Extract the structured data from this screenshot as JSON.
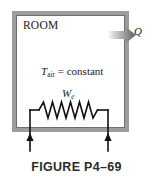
{
  "figure": {
    "caption": "FIGURE P4–69",
    "room_label": "ROOM",
    "temperature_label": {
      "symbol": "T",
      "subscript": "air",
      "relation": " = constant",
      "full_text": "T_air = constant"
    },
    "work_label": {
      "symbol": "W",
      "subscript": "e",
      "full_text": "W_e"
    },
    "heat_label": {
      "symbol": "Q",
      "full_text": "Q"
    },
    "elements": {
      "room_boundary": "room-wall-box",
      "heat_arrow": "heat-out-arrow",
      "resistor": "electric-resistance-heater",
      "inlet_arrow_left": "current-arrow-left",
      "inlet_arrow_right": "current-arrow-right"
    },
    "colors": {
      "wall": "#9d9d9d",
      "wall_edge": "#6e6e6e",
      "line": "#111111",
      "text": "#1a1a1a",
      "caption_text": "#2b2b2b",
      "background": "#ffffff"
    }
  }
}
